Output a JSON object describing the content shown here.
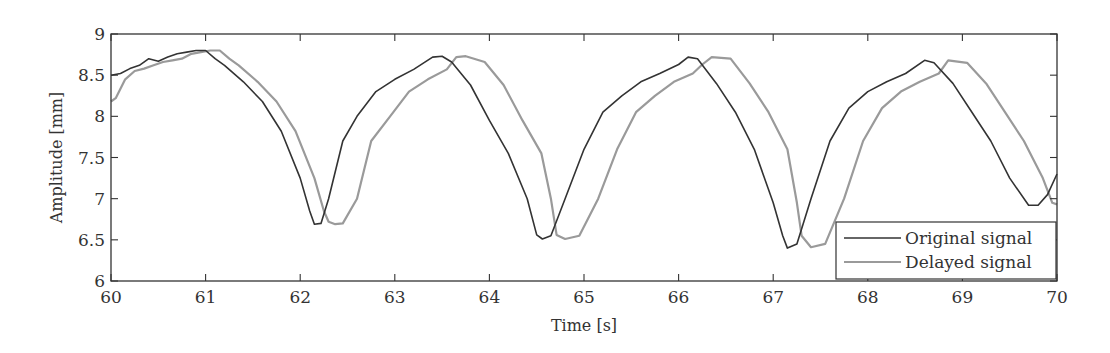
{
  "chart_data": {
    "type": "line",
    "title": "",
    "xlabel": "Time [s]",
    "ylabel": "Amplitude [mm]",
    "xlim": [
      60,
      70
    ],
    "ylim": [
      6,
      9
    ],
    "xticks": [
      60,
      61,
      62,
      63,
      64,
      65,
      66,
      67,
      68,
      69,
      70
    ],
    "yticks": [
      6,
      6.5,
      7,
      7.5,
      8,
      8.5,
      9
    ],
    "xtick_labels": [
      "60",
      "61",
      "62",
      "63",
      "64",
      "65",
      "66",
      "67",
      "68",
      "69",
      "70"
    ],
    "ytick_labels": [
      "6",
      "6.5",
      "7",
      "7.5",
      "8",
      "8.5",
      "9"
    ],
    "grid": false,
    "legend_position": "lower right",
    "series": [
      {
        "name": "Original signal",
        "color": "#333333",
        "x": [
          60.0,
          60.1,
          60.2,
          60.3,
          60.4,
          60.5,
          60.6,
          60.7,
          60.8,
          60.9,
          61.0,
          61.1,
          61.2,
          61.4,
          61.6,
          61.8,
          62.0,
          62.1,
          62.15,
          62.22,
          62.3,
          62.45,
          62.6,
          62.8,
          63.0,
          63.2,
          63.4,
          63.5,
          63.6,
          63.8,
          64.0,
          64.2,
          64.4,
          64.5,
          64.56,
          64.65,
          64.8,
          65.0,
          65.2,
          65.4,
          65.6,
          65.8,
          66.0,
          66.1,
          66.2,
          66.4,
          66.6,
          66.8,
          67.0,
          67.1,
          67.15,
          67.25,
          67.4,
          67.6,
          67.8,
          68.0,
          68.2,
          68.4,
          68.6,
          68.7,
          68.9,
          69.1,
          69.3,
          69.5,
          69.7,
          69.8,
          69.9,
          70.0
        ],
        "values": [
          8.5,
          8.52,
          8.58,
          8.62,
          8.7,
          8.67,
          8.72,
          8.76,
          8.78,
          8.8,
          8.8,
          8.7,
          8.62,
          8.42,
          8.18,
          7.82,
          7.25,
          6.85,
          6.69,
          6.7,
          7.0,
          7.7,
          8.0,
          8.3,
          8.45,
          8.57,
          8.72,
          8.73,
          8.66,
          8.38,
          7.95,
          7.55,
          7.0,
          6.56,
          6.51,
          6.55,
          7.0,
          7.6,
          8.05,
          8.25,
          8.42,
          8.52,
          8.63,
          8.72,
          8.7,
          8.4,
          8.05,
          7.6,
          6.95,
          6.55,
          6.4,
          6.45,
          7.0,
          7.7,
          8.1,
          8.3,
          8.42,
          8.52,
          8.68,
          8.65,
          8.4,
          8.05,
          7.7,
          7.25,
          6.92,
          6.92,
          7.05,
          7.3
        ]
      },
      {
        "name": "Delayed signal",
        "color": "#9a9a9a",
        "x": [
          60.0,
          60.05,
          60.15,
          60.25,
          60.35,
          60.45,
          60.55,
          60.65,
          60.75,
          60.85,
          60.95,
          61.05,
          61.15,
          61.25,
          61.35,
          61.55,
          61.75,
          61.95,
          62.15,
          62.25,
          62.3,
          62.37,
          62.45,
          62.6,
          62.75,
          62.95,
          63.15,
          63.35,
          63.55,
          63.65,
          63.75,
          63.95,
          64.15,
          64.35,
          64.55,
          64.65,
          64.71,
          64.8,
          64.95,
          65.15,
          65.35,
          65.55,
          65.75,
          65.95,
          66.15,
          66.25,
          66.35,
          66.55,
          66.75,
          66.95,
          67.15,
          67.25,
          67.3,
          67.4,
          67.55,
          67.75,
          67.95,
          68.15,
          68.35,
          68.55,
          68.75,
          68.85,
          69.05,
          69.25,
          69.45,
          69.65,
          69.85,
          69.95,
          70.0
        ],
        "values": [
          8.18,
          8.22,
          8.45,
          8.55,
          8.58,
          8.62,
          8.66,
          8.68,
          8.7,
          8.76,
          8.78,
          8.8,
          8.8,
          8.7,
          8.62,
          8.42,
          8.18,
          7.82,
          7.25,
          6.85,
          6.72,
          6.69,
          6.7,
          7.0,
          7.7,
          8.0,
          8.3,
          8.45,
          8.57,
          8.72,
          8.73,
          8.66,
          8.38,
          7.95,
          7.55,
          7.0,
          6.56,
          6.51,
          6.55,
          7.0,
          7.6,
          8.05,
          8.25,
          8.42,
          8.52,
          8.63,
          8.72,
          8.7,
          8.4,
          8.05,
          7.6,
          6.95,
          6.55,
          6.41,
          6.45,
          7.0,
          7.7,
          8.1,
          8.3,
          8.42,
          8.52,
          8.68,
          8.65,
          8.4,
          8.05,
          7.7,
          7.25,
          6.95,
          6.93
        ]
      }
    ]
  },
  "plot_area": {
    "left": 111,
    "top": 34,
    "right": 1057,
    "bottom": 281
  },
  "legend": {
    "items": [
      {
        "label": "Original signal",
        "color": "#333333"
      },
      {
        "label": "Delayed signal",
        "color": "#9a9a9a"
      }
    ]
  }
}
